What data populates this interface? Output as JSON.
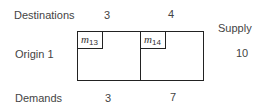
{
  "labels": {
    "destinations": "Destinations",
    "supply": "Supply",
    "origin": "Origin 1",
    "demands": "Demands"
  },
  "destinations": [
    {
      "number": "3",
      "cost_var": "m",
      "cost_sub": "13",
      "demand": "3"
    },
    {
      "number": "4",
      "cost_var": "m",
      "cost_sub": "14",
      "demand": "7"
    }
  ],
  "origin": {
    "supply": "10"
  }
}
